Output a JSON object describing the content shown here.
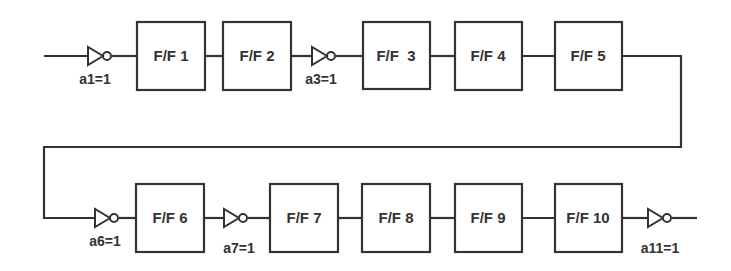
{
  "diagram": {
    "type": "shift-register-chain",
    "stroke_color": "#333333",
    "flip_flops": [
      {
        "id": "ff1",
        "label": "F/F 1",
        "row": 1
      },
      {
        "id": "ff2",
        "label": "F/F 2",
        "row": 1
      },
      {
        "id": "ff3",
        "label": "F/F  3",
        "row": 1
      },
      {
        "id": "ff4",
        "label": "F/F 4",
        "row": 1
      },
      {
        "id": "ff5",
        "label": "F/F 5",
        "row": 1
      },
      {
        "id": "ff6",
        "label": "F/F 6",
        "row": 2
      },
      {
        "id": "ff7",
        "label": "F/F 7",
        "row": 2
      },
      {
        "id": "ff8",
        "label": "F/F 8",
        "row": 2
      },
      {
        "id": "ff9",
        "label": "F/F 9",
        "row": 2
      },
      {
        "id": "ff10",
        "label": "F/F 10",
        "row": 2
      }
    ],
    "inverters": [
      {
        "id": "inv-a1",
        "label": "a1=1",
        "position": "before F/F 1"
      },
      {
        "id": "inv-a3",
        "label": "a3=1",
        "position": "between F/F 2 and F/F 3"
      },
      {
        "id": "inv-a6",
        "label": "a6=1",
        "position": "before F/F 6"
      },
      {
        "id": "inv-a7",
        "label": "a7=1",
        "position": "between F/F 6 and F/F 7"
      },
      {
        "id": "inv-a11",
        "label": "a11=1",
        "position": "after F/F 10"
      }
    ]
  }
}
